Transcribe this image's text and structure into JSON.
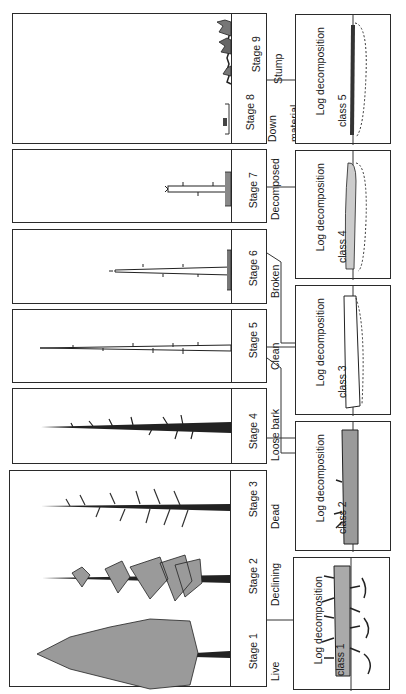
{
  "figure": {
    "stages": [
      {
        "id": 1,
        "line1": "Stage 1",
        "line2": "Live"
      },
      {
        "id": 2,
        "line1": "Stage 2",
        "line2": "Declining"
      },
      {
        "id": 3,
        "line1": "Stage 3",
        "line2": "Dead"
      },
      {
        "id": 4,
        "line1": "Stage 4",
        "line2": "Loose bark"
      },
      {
        "id": 5,
        "line1": "Stage 5",
        "line2": "Clean"
      },
      {
        "id": 6,
        "line1": "Stage 6",
        "line2": "Broken"
      },
      {
        "id": 7,
        "line1": "Stage 7",
        "line2": "Decomposed"
      },
      {
        "id": 8,
        "line1": "Stage 8",
        "line2": "Down",
        "line3": "material"
      },
      {
        "id": 9,
        "line1": "Stage 9",
        "line2": "Stump"
      }
    ],
    "log_classes": [
      {
        "id": 1,
        "line1": "Log decomposition",
        "line2": "class 1"
      },
      {
        "id": 2,
        "line1": "Log decomposition",
        "line2": "class 2"
      },
      {
        "id": 3,
        "line1": "Log decomposition",
        "line2": "class 3"
      },
      {
        "id": 4,
        "line1": "Log decomposition",
        "line2": "class 4"
      },
      {
        "id": 5,
        "line1": "Log decomposition",
        "line2": "class 5"
      }
    ],
    "mappings": [
      {
        "stages": [
          1,
          2,
          3
        ],
        "log_class": 1
      },
      {
        "stages": [
          4,
          5
        ],
        "log_class": 2
      },
      {
        "stages": [
          5,
          6
        ],
        "log_class": 3
      },
      {
        "stages": [
          6,
          7
        ],
        "log_class": 4
      },
      {
        "stages": [
          8,
          9
        ],
        "log_class": 5
      }
    ],
    "colors": {
      "line": "#2a2a2a",
      "background": "#ffffff",
      "foliage": "#8a8a8a"
    }
  }
}
